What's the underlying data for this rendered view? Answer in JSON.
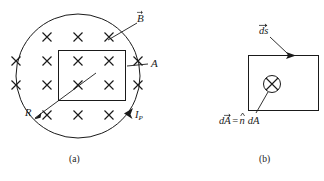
{
  "figure": {
    "kind": "physics-diagram",
    "background_color": "#ffffff",
    "ink_color": "#1a1a1a",
    "width": 324,
    "height": 181
  },
  "panel_a": {
    "caption": "(a)",
    "field_symbol": "×",
    "field_direction": "into-page",
    "field_rows": [
      3,
      5,
      5,
      5,
      3
    ],
    "field_total_count": 21,
    "labels": {
      "field_vector": "B",
      "field_vector_accent": "arrow",
      "area": "A",
      "radius": "R",
      "current": "I",
      "current_subscript": "P"
    },
    "shapes": {
      "circle_label": "solenoid-cross-section",
      "rectangle_label": "loop-area"
    }
  },
  "panel_b": {
    "caption": "(b)",
    "labels": {
      "path_element": "ds",
      "path_element_accent": "arrow",
      "area_vector": "dA",
      "area_vector_accent": "arrow",
      "equals": "=",
      "normal_unit": "n",
      "normal_unit_accent": "hat",
      "area_differential": "dA"
    },
    "center_symbol": "⊗",
    "center_symbol_meaning": "vector-into-page"
  }
}
